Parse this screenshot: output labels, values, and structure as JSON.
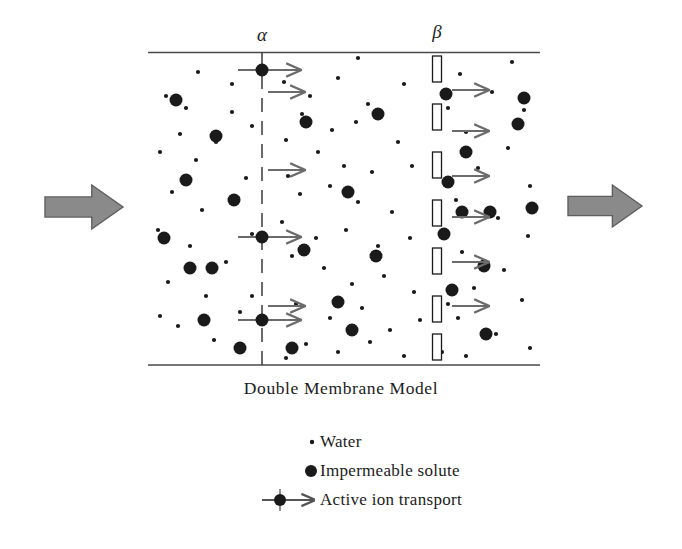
{
  "figure": {
    "caption": "Double Membrane Model",
    "membrane_labels": {
      "alpha": "α",
      "beta": "β"
    }
  },
  "legend": {
    "items": [
      {
        "symbol": "small-dot",
        "label": "Water"
      },
      {
        "symbol": "large-dot",
        "label": "Impermeable solute"
      },
      {
        "symbol": "arrow-through-dot",
        "label": "Active ion transport"
      }
    ]
  },
  "colors": {
    "ink": "#1a1a1a",
    "frame": "#4a4a4a",
    "block_arrow_fill": "#8a8a8a",
    "block_arrow_stroke": "#5e5e5e",
    "transport_arrow": "#6b6b6b",
    "membrane_rect_fill": "#ffffff",
    "background": "#ffffff"
  },
  "chart_data": {
    "type": "scatter",
    "title": "Double Membrane Model",
    "xlabel": "",
    "ylabel": "",
    "xlim": [
      148,
      540
    ],
    "ylim": [
      52,
      365
    ],
    "grid": false,
    "legend_position": "bottom-center",
    "annotations": [
      "α",
      "β"
    ],
    "frame": {
      "x0": 148,
      "x1": 540,
      "y_top": 52,
      "y_bottom": 365
    },
    "membranes": [
      {
        "name": "alpha",
        "label": "α",
        "style": "dashed-line",
        "x": 262,
        "y_top": 52,
        "y_bottom": 365
      },
      {
        "name": "beta",
        "label": "β",
        "style": "open-rectangles",
        "x": 437,
        "y_top": 52,
        "y_bottom": 365,
        "rect_width": 9,
        "rect_height": 26,
        "rect_y_positions": [
          56,
          104,
          152,
          200,
          248,
          296,
          334
        ]
      }
    ],
    "series": [
      {
        "name": "Water",
        "marker": "small-dot",
        "radius": 2.1,
        "points": [
          [
            166,
            96
          ],
          [
            198,
            72
          ],
          [
            232,
            112
          ],
          [
            252,
            126
          ],
          [
            180,
            134
          ],
          [
            160,
            152
          ],
          [
            216,
            142
          ],
          [
            246,
            178
          ],
          [
            172,
            192
          ],
          [
            202,
            210
          ],
          [
            238,
            198
          ],
          [
            158,
            230
          ],
          [
            190,
            246
          ],
          [
            226,
            262
          ],
          [
            252,
            234
          ],
          [
            168,
            282
          ],
          [
            206,
            296
          ],
          [
            240,
            312
          ],
          [
            178,
            326
          ],
          [
            214,
            340
          ],
          [
            252,
            296
          ],
          [
            160,
            316
          ],
          [
            196,
            160
          ],
          [
            232,
            84
          ],
          [
            186,
            108
          ],
          [
            284,
            82
          ],
          [
            310,
            96
          ],
          [
            338,
            78
          ],
          [
            404,
            84
          ],
          [
            368,
            104
          ],
          [
            302,
            114
          ],
          [
            332,
            130
          ],
          [
            356,
            122
          ],
          [
            286,
            140
          ],
          [
            398,
            142
          ],
          [
            318,
            152
          ],
          [
            344,
            166
          ],
          [
            288,
            176
          ],
          [
            372,
            172
          ],
          [
            412,
            166
          ],
          [
            300,
            194
          ],
          [
            330,
            186
          ],
          [
            358,
            202
          ],
          [
            392,
            212
          ],
          [
            282,
            222
          ],
          [
            316,
            238
          ],
          [
            346,
            230
          ],
          [
            378,
            246
          ],
          [
            410,
            238
          ],
          [
            292,
            256
          ],
          [
            324,
            268
          ],
          [
            352,
            284
          ],
          [
            384,
            276
          ],
          [
            414,
            292
          ],
          [
            296,
            304
          ],
          [
            330,
            318
          ],
          [
            362,
            308
          ],
          [
            390,
            330
          ],
          [
            420,
            320
          ],
          [
            306,
            344
          ],
          [
            338,
            352
          ],
          [
            370,
            342
          ],
          [
            404,
            356
          ],
          [
            286,
            358
          ],
          [
            358,
            58
          ],
          [
            460,
            74
          ],
          [
            492,
            92
          ],
          [
            524,
            110
          ],
          [
            466,
            132
          ],
          [
            508,
            148
          ],
          [
            478,
            168
          ],
          [
            530,
            186
          ],
          [
            456,
            200
          ],
          [
            498,
            218
          ],
          [
            528,
            236
          ],
          [
            462,
            252
          ],
          [
            504,
            270
          ],
          [
            474,
            288
          ],
          [
            522,
            300
          ],
          [
            458,
            318
          ],
          [
            496,
            334
          ],
          [
            530,
            348
          ],
          [
            466,
            356
          ],
          [
            512,
            62
          ],
          [
            448,
            108
          ],
          [
            444,
            236
          ],
          [
            448,
            304
          ],
          [
            442,
            352
          ]
        ]
      },
      {
        "name": "Impermeable solute",
        "marker": "large-dot",
        "radius": 6.5,
        "points": [
          [
            176,
            100
          ],
          [
            216,
            136
          ],
          [
            186,
            180
          ],
          [
            164,
            238
          ],
          [
            212,
            268
          ],
          [
            190,
            268
          ],
          [
            204,
            320
          ],
          [
            240,
            348
          ],
          [
            234,
            200
          ],
          [
            306,
            122
          ],
          [
            378,
            114
          ],
          [
            348,
            192
          ],
          [
            304,
            250
          ],
          [
            376,
            256
          ],
          [
            338,
            302
          ],
          [
            352,
            330
          ],
          [
            292,
            348
          ],
          [
            446,
            94
          ],
          [
            466,
            152
          ],
          [
            448,
            182
          ],
          [
            444,
            234
          ],
          [
            462,
            212
          ],
          [
            490,
            212
          ],
          [
            524,
            98
          ],
          [
            532,
            208
          ],
          [
            484,
            266
          ],
          [
            452,
            290
          ],
          [
            486,
            334
          ],
          [
            518,
            124
          ]
        ]
      }
    ],
    "active_transport_alpha": [
      {
        "x": 262,
        "y": 70,
        "line_x0": 238,
        "arrow_x1": 300
      },
      {
        "x": 262,
        "y": 237,
        "line_x0": 238,
        "arrow_x1": 300
      },
      {
        "x": 262,
        "y": 320,
        "line_x0": 238,
        "arrow_x1": 300
      }
    ],
    "transport_arrows_alpha": [
      {
        "x0": 268,
        "x1": 304,
        "y": 92
      },
      {
        "x0": 268,
        "x1": 304,
        "y": 170
      },
      {
        "x0": 268,
        "x1": 304,
        "y": 306
      }
    ],
    "transport_arrows_beta": [
      {
        "x0": 452,
        "x1": 488,
        "y": 90
      },
      {
        "x0": 452,
        "x1": 488,
        "y": 131
      },
      {
        "x0": 452,
        "x1": 488,
        "y": 176
      },
      {
        "x0": 452,
        "x1": 488,
        "y": 217
      },
      {
        "x0": 452,
        "x1": 488,
        "y": 262
      },
      {
        "x0": 452,
        "x1": 488,
        "y": 306
      }
    ],
    "flow_arrows": [
      {
        "name": "inflow",
        "direction": "right",
        "x": 45,
        "y": 185,
        "width": 78,
        "height": 44
      },
      {
        "name": "outflow",
        "direction": "right",
        "x": 568,
        "y": 185,
        "width": 74,
        "height": 42
      }
    ]
  }
}
